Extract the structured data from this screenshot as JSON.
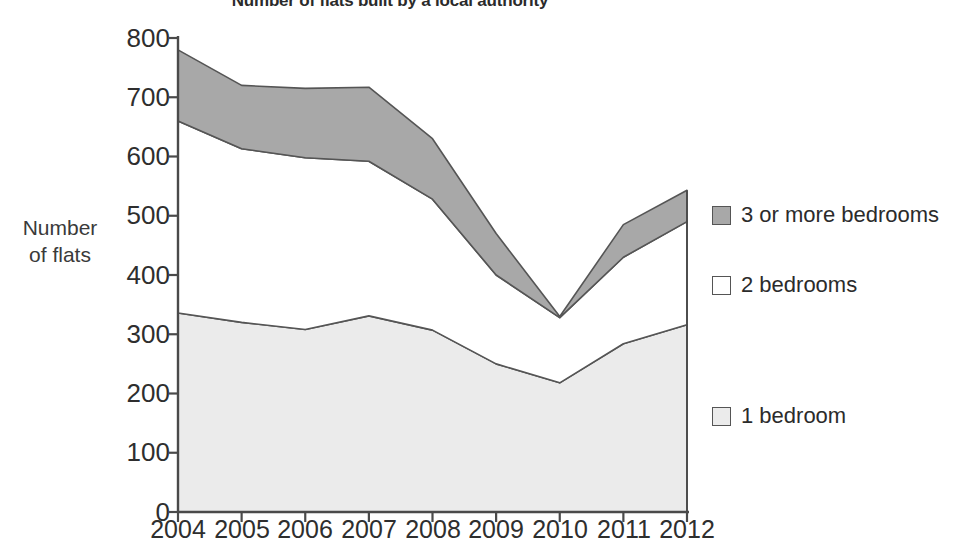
{
  "chart_data": {
    "type": "area",
    "title": "Number of flats built by a local authority",
    "xlabel": "",
    "ylabel": "Number of flats",
    "ylabel_lines": [
      "Number",
      "of flats"
    ],
    "categories": [
      "2004",
      "2005",
      "2006",
      "2007",
      "2008",
      "2009",
      "2010",
      "2011",
      "2012"
    ],
    "x": [
      2004,
      2005,
      2006,
      2007,
      2008,
      2009,
      2010,
      2011,
      2012
    ],
    "stacked": true,
    "ylim": [
      0,
      800
    ],
    "xlim": [
      2004,
      2012
    ],
    "ytick_labels": [
      "0",
      "100",
      "200",
      "300",
      "400",
      "500",
      "600",
      "700",
      "800"
    ],
    "yticks": [
      0,
      100,
      200,
      300,
      400,
      500,
      600,
      700,
      800
    ],
    "grid": false,
    "legend_position": "right",
    "series": [
      {
        "name": "1 bedroom",
        "color": "#ebebeb",
        "values": [
          336,
          320,
          308,
          331,
          307,
          250,
          218,
          284,
          316
        ],
        "cumulative": [
          336,
          320,
          308,
          331,
          307,
          250,
          218,
          284,
          316
        ]
      },
      {
        "name": "2 bedrooms",
        "color": "#ffffff",
        "values": [
          324,
          293,
          290,
          261,
          221,
          150,
          110,
          146,
          174
        ],
        "cumulative": [
          660,
          613,
          598,
          592,
          528,
          400,
          328,
          430,
          490
        ]
      },
      {
        "name": "3 or more bedrooms",
        "color": "#a8a8a8",
        "values": [
          120,
          107,
          117,
          125,
          102,
          70,
          2,
          55,
          53
        ],
        "cumulative": [
          780,
          720,
          715,
          717,
          630,
          470,
          330,
          485,
          543
        ]
      }
    ],
    "legend": [
      {
        "label": "3 or more bedrooms",
        "swatch_color": "#a8a8a8"
      },
      {
        "label": "2 bedrooms",
        "swatch_color": "#ffffff"
      },
      {
        "label": "1 bedroom",
        "swatch_color": "#ebebeb"
      }
    ],
    "axis_color": "#4a4a4a",
    "line_color": "#555555"
  }
}
